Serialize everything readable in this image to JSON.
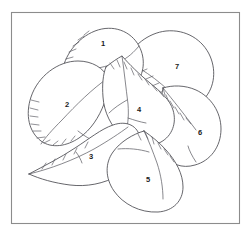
{
  "figure": {
    "kind": "line-drawing",
    "background_color": "#ffffff",
    "frame": {
      "name": "figure-border",
      "stroke_color": "#8c8c8c",
      "x": 11,
      "y": 12,
      "width": 229,
      "height": 212
    },
    "ink_color": "#4a4a50",
    "label_color": "#1a1a1a",
    "leaves": [
      {
        "id": 1,
        "label": "1",
        "label_x": 103,
        "label_y": 44,
        "description": "upper-centre leaf, serrate left margin, apex pointing down-left"
      },
      {
        "id": 2,
        "label": "2",
        "label_x": 67,
        "label_y": 105,
        "description": "left leaf, strongly serrate lower-left margin"
      },
      {
        "id": 3,
        "label": "3",
        "label_x": 91,
        "label_y": 157,
        "description": "lower-left leaf, acute tip at left"
      },
      {
        "id": 4,
        "label": "4",
        "label_x": 139,
        "label_y": 110,
        "description": "central leaf, serrate upper margin, midrib visible"
      },
      {
        "id": 5,
        "label": "5",
        "label_x": 148,
        "label_y": 180,
        "description": "lower-centre leaf, broad ovate"
      },
      {
        "id": 6,
        "label": "6",
        "label_x": 200,
        "label_y": 133,
        "description": "right leaf, serrate upper-left margin"
      },
      {
        "id": 7,
        "label": "7",
        "label_x": 177,
        "label_y": 67,
        "description": "upper-right leaf, serrate lower-left margin"
      }
    ]
  }
}
